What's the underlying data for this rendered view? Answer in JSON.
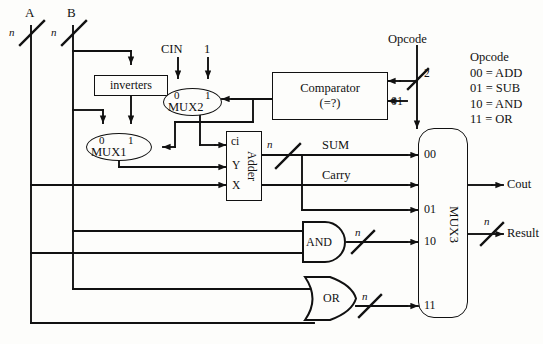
{
  "diagram": {
    "inputs": {
      "a": {
        "label": "A",
        "width": "n"
      },
      "b": {
        "label": "B",
        "width": "n"
      },
      "cin": {
        "label": "CIN"
      },
      "const_one": {
        "label": "1"
      },
      "opcode": {
        "label": "Opcode",
        "width": "2"
      }
    },
    "blocks": {
      "inverters": {
        "label": "inverters"
      },
      "comparator": {
        "line1": "Comparator",
        "line2": "(=?)",
        "compare_value": "01"
      },
      "adder": {
        "label": "Adder",
        "port_ci": "ci",
        "port_y": "Y",
        "port_x": "X"
      },
      "mux1": {
        "label": "MUX1",
        "sel0": "0",
        "sel1": "1"
      },
      "mux2": {
        "label": "MUX2",
        "sel0": "0",
        "sel1": "1"
      },
      "mux3": {
        "label": "MUX3",
        "in00": "00",
        "in01": "01",
        "in10": "10",
        "in11": "11"
      },
      "and_gate": {
        "label": "AND"
      },
      "or_gate": {
        "label": "OR"
      }
    },
    "signals": {
      "sum": "SUM",
      "carry": "Carry",
      "bus_n": "n",
      "opcode_width": "2"
    },
    "outputs": {
      "cout": {
        "label": "Cout"
      },
      "result": {
        "label": "Result",
        "width": "n"
      }
    },
    "legend": {
      "title": "Opcode",
      "rows": [
        "00 = ADD",
        "01 = SUB",
        "10 = AND",
        "11 = OR"
      ]
    },
    "colors": {
      "ink": "#111111",
      "paper": "#fdfdfb"
    }
  }
}
